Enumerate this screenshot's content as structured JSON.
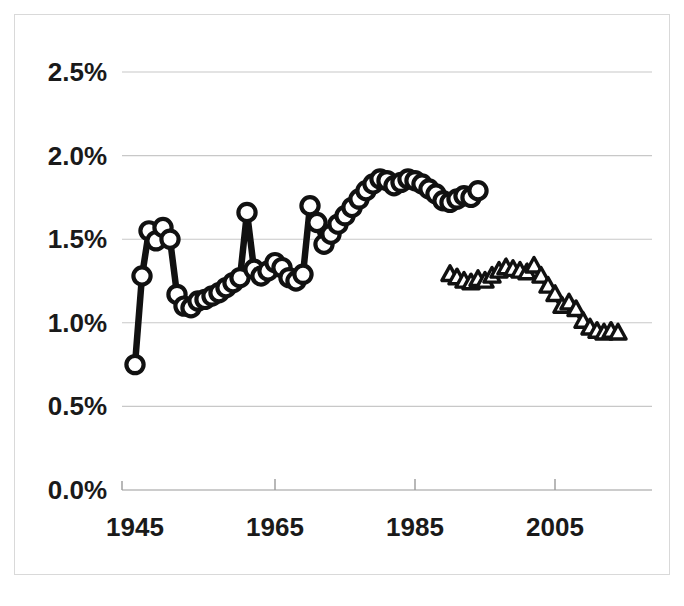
{
  "chart_data": {
    "type": "line",
    "title": "",
    "subtitle": "",
    "xlabel": "",
    "ylabel": "",
    "xlim": [
      1943,
      2016
    ],
    "ylim": [
      0.0,
      2.5
    ],
    "grid": true,
    "legend_position": "none",
    "y_tick_labels": [
      "0.0%",
      "0.5%",
      "1.0%",
      "1.5%",
      "2.0%",
      "2.5%"
    ],
    "y_tick_values": [
      0.0,
      0.5,
      1.0,
      1.5,
      2.0,
      2.5
    ],
    "x_tick_labels": [
      "1945",
      "1965",
      "1985",
      "2005"
    ],
    "x_tick_values": [
      1945,
      1965,
      1985,
      2005
    ],
    "series": [
      {
        "name": "series-circles",
        "marker": "circle",
        "x": [
          1945,
          1946,
          1947,
          1948,
          1949,
          1950,
          1951,
          1952,
          1953,
          1954,
          1955,
          1956,
          1957,
          1958,
          1959,
          1960,
          1961,
          1962,
          1963,
          1964,
          1965,
          1966,
          1967,
          1968,
          1969,
          1970,
          1971,
          1972,
          1973,
          1974,
          1975,
          1976,
          1977,
          1978,
          1979,
          1980,
          1981,
          1982,
          1983,
          1984,
          1985,
          1986,
          1987,
          1988,
          1989,
          1990,
          1991,
          1992,
          1993,
          1994
        ],
        "y": [
          0.75,
          1.28,
          1.55,
          1.49,
          1.57,
          1.5,
          1.17,
          1.1,
          1.09,
          1.13,
          1.14,
          1.16,
          1.18,
          1.21,
          1.24,
          1.27,
          1.66,
          1.32,
          1.28,
          1.31,
          1.36,
          1.33,
          1.27,
          1.25,
          1.29,
          1.7,
          1.6,
          1.47,
          1.53,
          1.59,
          1.64,
          1.69,
          1.74,
          1.79,
          1.83,
          1.86,
          1.85,
          1.82,
          1.84,
          1.86,
          1.85,
          1.83,
          1.8,
          1.77,
          1.73,
          1.72,
          1.74,
          1.76,
          1.75,
          1.79
        ]
      },
      {
        "name": "series-triangles",
        "marker": "triangle",
        "x": [
          1990,
          1991,
          1992,
          1993,
          1994,
          1995,
          1996,
          1997,
          1998,
          1999,
          2000,
          2001,
          2002,
          2003,
          2004,
          2005,
          2006,
          2007,
          2008,
          2009,
          2010,
          2011,
          2012,
          2013,
          2014
        ],
        "y": [
          1.29,
          1.27,
          1.25,
          1.24,
          1.26,
          1.25,
          1.28,
          1.31,
          1.33,
          1.32,
          1.31,
          1.3,
          1.34,
          1.28,
          1.22,
          1.17,
          1.1,
          1.12,
          1.08,
          1.01,
          0.97,
          0.95,
          0.94,
          0.95,
          0.94
        ]
      }
    ]
  },
  "axes": {
    "y_axis_name": "percent-axis",
    "x_axis_name": "year-axis"
  }
}
